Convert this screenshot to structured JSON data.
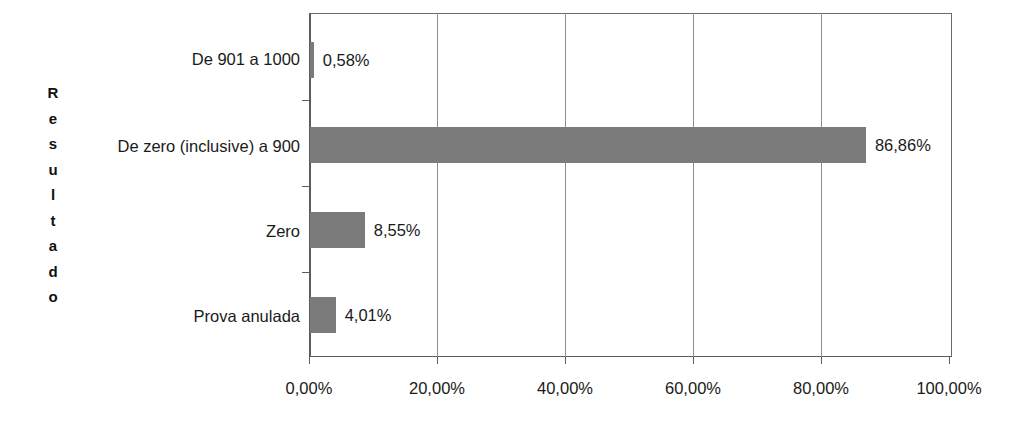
{
  "chart_data": {
    "type": "bar",
    "orientation": "horizontal",
    "title": "",
    "subtitle": "",
    "xlabel": "",
    "ylabel": "Resultado",
    "categories": [
      "De 901 a 1000",
      "De zero (inclusive) a 900",
      "Zero",
      "Prova anulada"
    ],
    "values": [
      0.58,
      86.86,
      8.55,
      4.01
    ],
    "data_labels": [
      "0,58%",
      "86,86%",
      "8,55%",
      "4,01%"
    ],
    "xlim": [
      0,
      100
    ],
    "ylim": null,
    "xticks": [
      0,
      20,
      40,
      60,
      80,
      100
    ],
    "xtick_labels": [
      "0,00%",
      "20,00%",
      "40,00%",
      "60,00%",
      "80,00%",
      "100,00%"
    ],
    "grid": "vertical",
    "legend": null,
    "series": [
      {
        "name": "Resultado",
        "values": [
          0.58,
          86.86,
          8.55,
          4.01
        ],
        "color": "#7b7b7b"
      }
    ],
    "colors": {
      "bar_fill": "#7b7b7b",
      "axis": "#5c5c5c",
      "gridline": "#8e8e8e",
      "text": "#1a1a1a",
      "background": "#ffffff"
    }
  },
  "axis_title_letters": [
    "R",
    "e",
    "s",
    "u",
    "l",
    "t",
    "a",
    "d",
    "o"
  ]
}
